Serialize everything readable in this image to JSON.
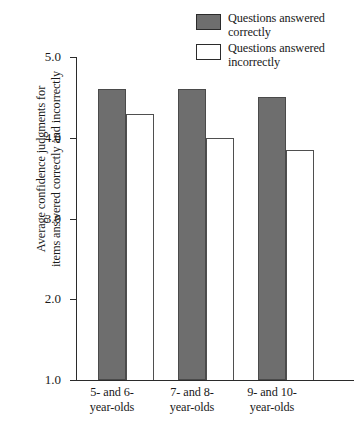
{
  "chart_data": {
    "type": "bar",
    "title": "",
    "xlabel": "",
    "ylabel": "Average confidence judgments for items answered correctly and incorrectly",
    "ylim": [
      1.0,
      5.0
    ],
    "yticks": [
      "1.0",
      "2.0",
      "3.0",
      "4.0",
      "5.0"
    ],
    "grid": false,
    "legend_position": "top-right",
    "categories": [
      "5- and 6- year-olds",
      "7- and 8- year-olds",
      "9- and 10- year-olds"
    ],
    "category_lines": [
      [
        "5- and 6-",
        "year-olds"
      ],
      [
        "7- and 8-",
        "year-olds"
      ],
      [
        "9- and 10-",
        "year-olds"
      ]
    ],
    "series": [
      {
        "name": "Questions answered correctly",
        "name_lines": [
          "Questions answered",
          "correctly"
        ],
        "color": "#6e6e6e",
        "values": [
          4.6,
          4.6,
          4.5
        ]
      },
      {
        "name": "Questions answered incorrectly",
        "name_lines": [
          "Questions answered",
          "incorrectly"
        ],
        "color": "#ffffff",
        "values": [
          4.3,
          4.0,
          3.85
        ]
      }
    ]
  },
  "axis_title_lines": [
    "Average confidence judgments for",
    "items answered correctly and incorrectly"
  ],
  "colors": {
    "bar_fill": "#6e6e6e",
    "bar_outline": "#4a4a4a",
    "axis": "#2b2b2b",
    "background": "#ffffff"
  }
}
